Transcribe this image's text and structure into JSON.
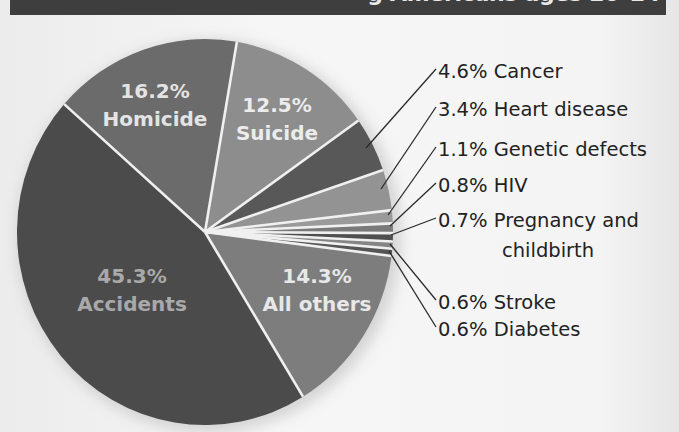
{
  "title": {
    "visible_text": "g Americans ages 20–24",
    "bg_color": "#3e3e3e"
  },
  "chart_data": {
    "type": "pie",
    "start_angle_deg": -48.5,
    "center": [
      205,
      232
    ],
    "radius": [
      188,
      193
    ],
    "slices": [
      {
        "name": "Homicide",
        "value": 16.2,
        "label_pct": "16.2%",
        "color": "#6b6b6b",
        "placement": "inside",
        "label_xy": [
          155,
          98
        ],
        "text_color": "#e4e4e4"
      },
      {
        "name": "Suicide",
        "value": 12.5,
        "label_pct": "12.5%",
        "color": "#8d8d8d",
        "placement": "inside",
        "label_xy": [
          277,
          112
        ],
        "text_color": "#ececec"
      },
      {
        "name": "Cancer",
        "value": 4.6,
        "label_pct": "4.6%",
        "color": "#585858",
        "placement": "outside",
        "label": "4.6% Cancer",
        "leader": [
          [
            366,
            148
          ],
          [
            436,
            69
          ]
        ]
      },
      {
        "name": "Heart disease",
        "value": 3.4,
        "label_pct": "3.4%",
        "color": "#939393",
        "placement": "outside",
        "label": "3.4% Heart disease",
        "leader": [
          [
            381,
            189
          ],
          [
            436,
            107
          ]
        ]
      },
      {
        "name": "Genetic defects",
        "value": 1.1,
        "label_pct": "1.1%",
        "color": "#9a9a9a",
        "placement": "outside",
        "label": "1.1% Genetic defects",
        "leader": [
          [
            388,
            215
          ],
          [
            436,
            147
          ]
        ]
      },
      {
        "name": "HIV",
        "value": 0.8,
        "label_pct": "0.8%",
        "color": "#7a7a7a",
        "placement": "outside",
        "label": "0.8% HIV",
        "leader": [
          [
            390,
            226
          ],
          [
            436,
            183
          ]
        ]
      },
      {
        "name": "Pregnancy and childbirth",
        "value": 0.7,
        "label_pct": "0.7%",
        "color": "#4f4f4f",
        "placement": "outside",
        "label": "0.7% Pregnancy and",
        "label_line2": "childbirth",
        "leader": [
          [
            391,
            235
          ],
          [
            436,
            218
          ]
        ]
      },
      {
        "name": "Stroke",
        "value": 0.6,
        "label_pct": "0.6%",
        "color": "#858585",
        "placement": "outside",
        "label": "0.6% Stroke",
        "leader": [
          [
            390,
            244
          ],
          [
            436,
            300
          ]
        ]
      },
      {
        "name": "Diabetes",
        "value": 0.6,
        "label_pct": "0.6%",
        "color": "#555555",
        "placement": "outside",
        "label": "0.6% Diabetes",
        "leader": [
          [
            389,
            251
          ],
          [
            436,
            327
          ]
        ]
      },
      {
        "name": "All others",
        "value": 14.3,
        "label_pct": "14.3%",
        "color": "#7d7d7d",
        "placement": "inside",
        "label_xy": [
          317,
          283
        ],
        "text_color": "#e8e8e8"
      },
      {
        "name": "Accidents",
        "value": 45.3,
        "label_pct": "45.3%",
        "color": "#4b4b4b",
        "placement": "inside",
        "label_xy": [
          132,
          283
        ],
        "text_color": "#a9a9a9"
      }
    ],
    "outside_labels": {
      "x": 438,
      "baselines": [
        78,
        116,
        156,
        192,
        227,
        257,
        309,
        336
      ]
    },
    "separator_color": "#f0f0f0",
    "legend": "none",
    "grid": false
  }
}
